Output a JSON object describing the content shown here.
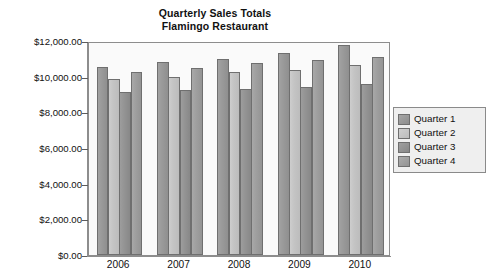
{
  "chart_data": {
    "type": "bar",
    "title": "Quarterly Sales Totals",
    "subtitle": "Flamingo Restaurant",
    "xlabel": "",
    "ylabel": "",
    "grid": false,
    "legend_position": "right",
    "ylim": [
      0,
      12000
    ],
    "ytick_step": 2000,
    "categories": [
      "2006",
      "2007",
      "2008",
      "2009",
      "2010"
    ],
    "ytick_labels": [
      "$12,000.00",
      "$10,000.00",
      "$8,000.00",
      "$6,000.00",
      "$4,000.00",
      "$2,000.00",
      "$0.00"
    ],
    "ytick_values": [
      12000,
      10000,
      8000,
      6000,
      4000,
      2000,
      0
    ],
    "series": [
      {
        "name": "Quarter 1",
        "color": "#9a9a9a",
        "values": [
          10550,
          10800,
          11000,
          11300,
          11750
        ]
      },
      {
        "name": "Quarter 2",
        "color": "#c4c4c4",
        "values": [
          9850,
          9980,
          10250,
          10400,
          10650
        ]
      },
      {
        "name": "Quarter 3",
        "color": "#949494",
        "values": [
          9150,
          9250,
          9300,
          9420,
          9600
        ]
      },
      {
        "name": "Quarter 4",
        "color": "#9f9f9f",
        "values": [
          10250,
          10480,
          10750,
          10930,
          11120
        ]
      }
    ]
  }
}
